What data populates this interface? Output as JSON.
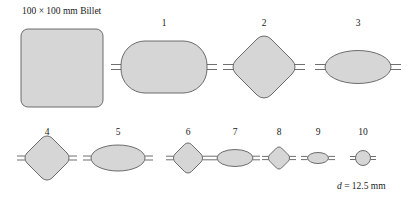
{
  "figure": {
    "billet_label": "100 × 100 mm Billet",
    "final_dimension_symbol": "d",
    "final_dimension_value": " = 12.5 mm",
    "fill_color": "#d6d6d6",
    "stroke_color": "#5e5e5e",
    "background_color": "#ffffff"
  },
  "billet": {
    "name": "100 × 100 mm Billet",
    "shape": "rounded-square",
    "cx": 62,
    "cy": 68,
    "width": 82,
    "height": 78,
    "corner_radius": 7
  },
  "top_row": [
    {
      "number": "1",
      "shape": "stadium",
      "cx": 164,
      "cy": 67,
      "width": 86,
      "height": 52,
      "corner_radius": 20,
      "label_x": 164,
      "label_y": 26,
      "fin": true
    },
    {
      "number": "2",
      "shape": "diamond",
      "cx": 264,
      "cy": 67,
      "width": 62,
      "height": 66,
      "corner_radius": 8,
      "label_x": 264,
      "label_y": 26,
      "fin": true
    },
    {
      "number": "3",
      "shape": "ellipse",
      "cx": 358,
      "cy": 67,
      "width": 66,
      "height": 33,
      "label_x": 358,
      "label_y": 26,
      "fin": true
    }
  ],
  "bottom_row": [
    {
      "number": "4",
      "shape": "diamond",
      "cx": 47,
      "cy": 160,
      "width": 44,
      "height": 48,
      "corner_radius": 6,
      "label_x": 47,
      "label_y": 135,
      "fin": true
    },
    {
      "number": "5",
      "shape": "ellipse",
      "cx": 118,
      "cy": 160,
      "width": 54,
      "height": 26,
      "label_x": 118,
      "label_y": 135,
      "fin": true
    },
    {
      "number": "6",
      "shape": "diamond",
      "cx": 188,
      "cy": 160,
      "width": 28,
      "height": 31,
      "corner_radius": 4,
      "label_x": 188,
      "label_y": 135,
      "fin": true
    },
    {
      "number": "7",
      "shape": "ellipse",
      "cx": 235,
      "cy": 160,
      "width": 36,
      "height": 17,
      "label_x": 235,
      "label_y": 135,
      "fin": true
    },
    {
      "number": "8",
      "shape": "diamond",
      "cx": 279,
      "cy": 160,
      "width": 21,
      "height": 23,
      "corner_radius": 3,
      "label_x": 279,
      "label_y": 135,
      "fin": true
    },
    {
      "number": "9",
      "shape": "ellipse",
      "cx": 318,
      "cy": 160,
      "width": 21,
      "height": 11,
      "label_x": 318,
      "label_y": 135,
      "fin": true
    },
    {
      "number": "10",
      "shape": "circle",
      "cx": 363,
      "cy": 160,
      "width": 15,
      "height": 15,
      "label_x": 363,
      "label_y": 135,
      "fin": true
    }
  ],
  "dimension_note": {
    "x": 337,
    "y": 186
  }
}
